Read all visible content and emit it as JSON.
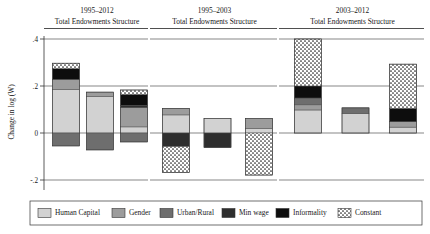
{
  "figure": {
    "y_axis_label": "Change in log (W)",
    "y_ticks": [
      ".4",
      ".2",
      "0",
      "-.2"
    ]
  },
  "chart_data": {
    "type": "bar",
    "title": "",
    "xlabel": "",
    "ylabel": "Change in log (W)",
    "ylim": [
      -0.28,
      0.44
    ],
    "ytick_values": [
      0.4,
      0.2,
      0.0,
      -0.2
    ],
    "ytick_labels": [
      ".4",
      ".2",
      "0",
      "-.2"
    ],
    "grid": true,
    "stacked": true,
    "legend_position": "bottom",
    "legend": [
      "Human Capital",
      "Gender",
      "Urban/Rural",
      "Min wage",
      "Informality",
      "Constant"
    ],
    "categories": [
      "Total",
      "Endowments",
      "Structure"
    ],
    "panels": [
      {
        "title": "1995–2012",
        "subtitle": "Total Endowments Structure",
        "bars": [
          {
            "category": "Total",
            "net": 0.258,
            "segments": [
              {
                "name": "Human Capital",
                "value": 0.185,
                "start": 0.0,
                "end": 0.185
              },
              {
                "name": "Gender",
                "value": 0.043,
                "start": 0.185,
                "end": 0.228
              },
              {
                "name": "Urban/Rural",
                "value": 0.0,
                "start": 0.228,
                "end": 0.228
              },
              {
                "name": "Min wage",
                "value": 0.0,
                "start": 0.228,
                "end": 0.228
              },
              {
                "name": "Informality",
                "value": 0.046,
                "start": 0.228,
                "end": 0.274
              },
              {
                "name": "Constant",
                "value": 0.023,
                "start": 0.274,
                "end": 0.297
              },
              {
                "name": "Urban/Rural (neg)",
                "value": -0.055,
                "start": 0.0,
                "end": -0.055
              }
            ]
          },
          {
            "category": "Endowments",
            "net": 0.105,
            "segments": [
              {
                "name": "Human Capital",
                "value": 0.155,
                "start": 0.0,
                "end": 0.155
              },
              {
                "name": "Gender",
                "value": 0.019,
                "start": 0.155,
                "end": 0.174
              },
              {
                "name": "Urban/Rural (neg)",
                "value": -0.072,
                "start": 0.0,
                "end": -0.072
              }
            ]
          },
          {
            "category": "Structure",
            "net": 0.13,
            "segments": [
              {
                "name": "Human Capital",
                "value": 0.026,
                "start": 0.0,
                "end": 0.026
              },
              {
                "name": "Gender",
                "value": 0.082,
                "start": 0.026,
                "end": 0.108
              },
              {
                "name": "Min wage",
                "value": 0.01,
                "start": 0.108,
                "end": 0.118
              },
              {
                "name": "Informality",
                "value": 0.046,
                "start": 0.118,
                "end": 0.164
              },
              {
                "name": "Constant",
                "value": 0.019,
                "start": 0.164,
                "end": 0.183
              },
              {
                "name": "Urban/Rural (neg)",
                "value": -0.038,
                "start": 0.0,
                "end": -0.038
              }
            ]
          }
        ]
      },
      {
        "title": "1995–2003",
        "subtitle": "Total Endowments Structure",
        "bars": [
          {
            "category": "Total",
            "net": -0.063,
            "segments": [
              {
                "name": "Human Capital",
                "value": 0.077,
                "start": 0.0,
                "end": 0.077
              },
              {
                "name": "Gender",
                "value": 0.028,
                "start": 0.077,
                "end": 0.105
              },
              {
                "name": "Min wage",
                "value": -0.058,
                "start": 0.0,
                "end": -0.058
              },
              {
                "name": "Constant",
                "value": -0.11,
                "start": -0.058,
                "end": -0.168
              }
            ]
          },
          {
            "category": "Endowments",
            "net": 0.0,
            "segments": [
              {
                "name": "Human Capital",
                "value": 0.062,
                "start": 0.0,
                "end": 0.062
              },
              {
                "name": "Min wage",
                "value": -0.062,
                "start": 0.0,
                "end": -0.062
              }
            ]
          },
          {
            "category": "Structure",
            "net": -0.117,
            "segments": [
              {
                "name": "Human Capital",
                "value": 0.019,
                "start": 0.0,
                "end": 0.019
              },
              {
                "name": "Gender",
                "value": 0.043,
                "start": 0.019,
                "end": 0.062
              },
              {
                "name": "Constant",
                "value": -0.179,
                "start": 0.0,
                "end": -0.179
              }
            ]
          }
        ]
      },
      {
        "title": "2003–2012",
        "subtitle": "Total Endowments Structure",
        "bars": [
          {
            "category": "Total",
            "net": 0.4,
            "segments": [
              {
                "name": "Human Capital",
                "value": 0.098,
                "start": 0.0,
                "end": 0.098
              },
              {
                "name": "Gender",
                "value": 0.022,
                "start": 0.098,
                "end": 0.12
              },
              {
                "name": "Urban/Rural",
                "value": 0.029,
                "start": 0.12,
                "end": 0.149
              },
              {
                "name": "Informality",
                "value": 0.051,
                "start": 0.149,
                "end": 0.2
              },
              {
                "name": "Constant",
                "value": 0.2,
                "start": 0.2,
                "end": 0.4
              }
            ]
          },
          {
            "category": "Endowments",
            "net": 0.107,
            "segments": [
              {
                "name": "Human Capital",
                "value": 0.082,
                "start": 0.0,
                "end": 0.082
              },
              {
                "name": "Urban/Rural",
                "value": 0.025,
                "start": 0.082,
                "end": 0.107
              }
            ]
          },
          {
            "category": "Structure",
            "net": 0.293,
            "segments": [
              {
                "name": "Human Capital",
                "value": 0.025,
                "start": 0.0,
                "end": 0.025
              },
              {
                "name": "Gender",
                "value": 0.023,
                "start": 0.025,
                "end": 0.048
              },
              {
                "name": "Informality",
                "value": 0.057,
                "start": 0.048,
                "end": 0.105
              },
              {
                "name": "Constant",
                "value": 0.188,
                "start": 0.105,
                "end": 0.293
              }
            ]
          }
        ]
      }
    ]
  }
}
